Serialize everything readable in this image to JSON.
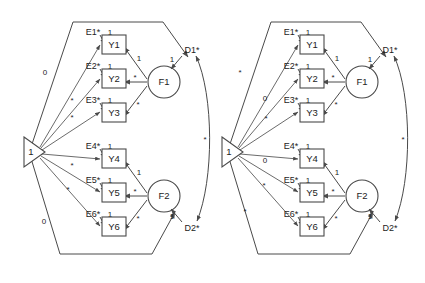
{
  "diagram": {
    "type": "sem-path-diagram",
    "stroke_color": "#4a4a4a",
    "text_color": "#1d1d1d",
    "background": "#ffffff"
  },
  "panels": [
    {
      "id": "left-panel",
      "constant": {
        "label": "1",
        "shape": "triangle"
      },
      "factors": [
        {
          "id": "F1",
          "label": "F1",
          "shape": "circle"
        },
        {
          "id": "F2",
          "label": "F2",
          "shape": "circle"
        }
      ],
      "indicators": [
        {
          "id": "Y1",
          "label": "Y1",
          "error": "E1*",
          "error_path_label": "1",
          "loading_label": "1"
        },
        {
          "id": "Y2",
          "label": "Y2",
          "error": "E2*",
          "error_path_label": "1",
          "loading_label": "*"
        },
        {
          "id": "Y3",
          "label": "Y3",
          "error": "E3*",
          "error_path_label": "1",
          "loading_label": "*"
        },
        {
          "id": "Y4",
          "label": "Y4",
          "error": "E4*",
          "error_path_label": "1",
          "loading_label": "1"
        },
        {
          "id": "Y5",
          "label": "Y5",
          "error": "E5*",
          "error_path_label": "1",
          "loading_label": "*"
        },
        {
          "id": "Y6",
          "label": "Y6",
          "error": "E6*",
          "error_path_label": "1",
          "loading_label": "*"
        }
      ],
      "disturbances": [
        {
          "id": "D1",
          "label": "D1*",
          "path_label": "1"
        },
        {
          "id": "D2",
          "label": "D2*",
          "path_label": "1"
        }
      ],
      "covariance": {
        "between": "D1*-D2*",
        "label": "*"
      },
      "mean_paths": [
        {
          "target": "Y1",
          "label": "0"
        },
        {
          "target": "Y2",
          "label": "*"
        },
        {
          "target": "Y3",
          "label": "*"
        },
        {
          "target": "Y4",
          "label": "*"
        },
        {
          "target": "Y5",
          "label": "*"
        },
        {
          "target": "Y6",
          "label": "0"
        }
      ],
      "factor_mean_paths": [
        {
          "target": "F1",
          "label": ""
        },
        {
          "target": "F2",
          "label": ""
        }
      ]
    },
    {
      "id": "right-panel",
      "constant": {
        "label": "1",
        "shape": "triangle"
      },
      "factors": [
        {
          "id": "F1",
          "label": "F1",
          "shape": "circle"
        },
        {
          "id": "F2",
          "label": "F2",
          "shape": "circle"
        }
      ],
      "indicators": [
        {
          "id": "Y1",
          "label": "Y1",
          "error": "E1*",
          "error_path_label": "1",
          "loading_label": "1"
        },
        {
          "id": "Y2",
          "label": "Y2",
          "error": "E2*",
          "error_path_label": "1",
          "loading_label": "*"
        },
        {
          "id": "Y3",
          "label": "Y3",
          "error": "E3*",
          "error_path_label": "1",
          "loading_label": "*"
        },
        {
          "id": "Y4",
          "label": "Y4",
          "error": "E4*",
          "error_path_label": "1",
          "loading_label": "1"
        },
        {
          "id": "Y5",
          "label": "Y5",
          "error": "E5*",
          "error_path_label": "1",
          "loading_label": "*"
        },
        {
          "id": "Y6",
          "label": "Y6",
          "error": "E6*",
          "error_path_label": "1",
          "loading_label": "*"
        }
      ],
      "disturbances": [
        {
          "id": "D1",
          "label": "D1*",
          "path_label": "1"
        },
        {
          "id": "D2",
          "label": "D2*",
          "path_label": "1"
        }
      ],
      "covariance": {
        "between": "D1*-D2*",
        "label": "*"
      },
      "mean_paths": [
        {
          "target": "Y1",
          "label": "*"
        },
        {
          "target": "Y2",
          "label": "0"
        },
        {
          "target": "Y3",
          "label": "*"
        },
        {
          "target": "Y4",
          "label": "0"
        },
        {
          "target": "Y5",
          "label": "*"
        },
        {
          "target": "Y6",
          "label": "*"
        }
      ],
      "factor_mean_paths": [
        {
          "target": "F1",
          "label": ""
        },
        {
          "target": "F2",
          "label": ""
        }
      ]
    }
  ]
}
